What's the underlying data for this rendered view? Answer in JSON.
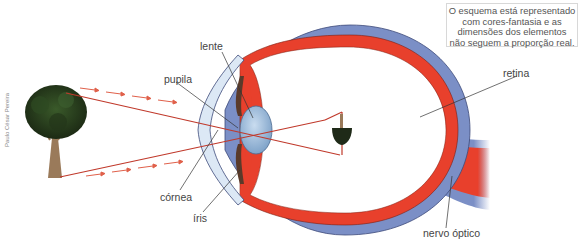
{
  "diagram": {
    "note": {
      "lines": [
        "O esquema está representado",
        "com cores-fantasia e as",
        "dimensões dos elementos",
        "não seguem a proporção real."
      ]
    },
    "credit": "Paulo César Pereira",
    "labels": {
      "lente": "lente",
      "pupila": "pupila",
      "cornea": "córnea",
      "iris": "íris",
      "retina": "retina",
      "nervo_optico": "nervo óptico"
    },
    "colors": {
      "sclera": "#7b8fc6",
      "choroid_retina": "#e8402c",
      "cornea": "#dce8f5",
      "lens": "#a9c4e0",
      "iris": "#5a3a2a",
      "light_ray": "#c0392b",
      "arrow": "#e0604a",
      "leader_line": "#333333"
    }
  }
}
